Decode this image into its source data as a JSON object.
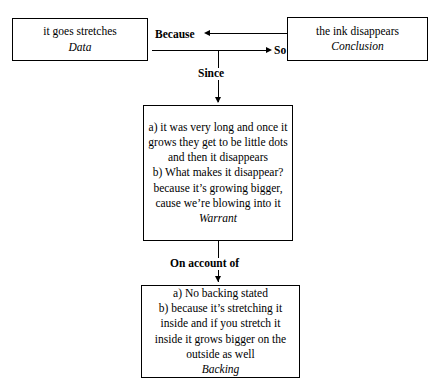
{
  "diagram": {
    "nodes": {
      "data": {
        "text": "it goes stretches",
        "role": "Data"
      },
      "conclusion": {
        "text": "the ink disappears",
        "role": "Conclusion"
      },
      "warrant": {
        "text": "a) it was very long and once it grows they get to be little dots and then it disappears\nb) What makes it disappear? because it’s growing bigger, cause we’re blowing into it",
        "role": "Warrant"
      },
      "backing": {
        "text": "a) No backing stated\nb) because it’s stretching it inside and if you stretch it inside it grows bigger on the outside as well",
        "role": "Backing"
      }
    },
    "connectors": {
      "because": "Because",
      "so": "So",
      "since": "Since",
      "on_account_of": "On account of"
    },
    "colors": {
      "stroke": "#000000",
      "background": "#ffffff",
      "text": "#000000"
    }
  }
}
